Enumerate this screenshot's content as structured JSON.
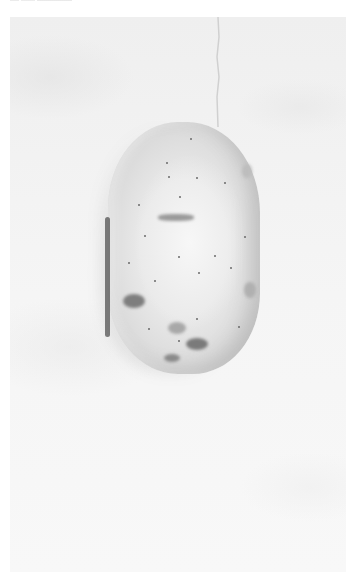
{
  "image": {
    "subject": "potato",
    "description": "Single pale potato with small dark eyes and blemishes, photographed on a light gray textured surface",
    "colors": {
      "background": "#f3f3f3",
      "potato_skin": "#e6e6e6",
      "potato_shadow": "#bdbdbd",
      "spots": "#6a6a6a"
    }
  }
}
